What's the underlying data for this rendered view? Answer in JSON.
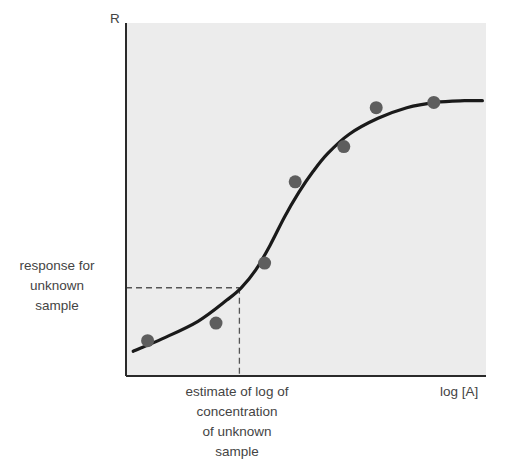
{
  "chart_data": {
    "type": "scatter",
    "title": "",
    "xlabel": "log [A]",
    "ylabel": "R",
    "grid": false,
    "legend": null,
    "xlim": [
      0,
      100
    ],
    "ylim": [
      0,
      100
    ],
    "series": [
      {
        "name": "measured standards",
        "kind": "scatter",
        "x": [
          6,
          25,
          38.5,
          47,
          60.5,
          69.5,
          85.5
        ],
        "y": [
          10,
          15,
          32,
          55,
          65,
          76,
          77.5
        ]
      },
      {
        "name": "fitted sigmoidal curve",
        "kind": "line",
        "x": [
          2,
          10,
          20,
          28,
          32,
          36,
          40,
          44,
          48,
          52,
          56,
          62,
          70,
          78,
          86,
          94,
          99
        ],
        "y": [
          7,
          10.5,
          15.5,
          21.5,
          25,
          30,
          37,
          45,
          52,
          58,
          63,
          68.5,
          73,
          76,
          77.5,
          78,
          78
        ]
      }
    ],
    "annotations": [
      {
        "type": "dashed-horizontal",
        "y": 25,
        "x_from": 0,
        "x_to": 31.5,
        "label": "response for unknown sample"
      },
      {
        "type": "dashed-vertical",
        "x": 31.5,
        "y_from": 0,
        "y_to": 25,
        "label": "estimate of log of concentration of unknown sample"
      }
    ],
    "colors": {
      "plot_background": "#ececec",
      "axis": "#2a2a2a",
      "curve": "#1a1a1a",
      "points": "#5e5e5e",
      "dashed": "#555555",
      "text": "#444444"
    }
  },
  "labels": {
    "y_axis": "R",
    "x_axis": "log [A]",
    "response_lines": [
      "response for",
      "unknown",
      "sample"
    ],
    "estimate_lines": [
      "estimate of log of",
      "concentration",
      "of unknown",
      "sample"
    ]
  },
  "layout": {
    "plot_left": 126,
    "plot_top": 23,
    "plot_right": 486,
    "plot_bottom": 376
  }
}
